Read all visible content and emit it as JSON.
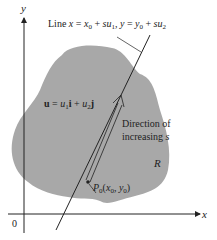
{
  "diagram": {
    "region_color": "#a8a8a8",
    "axes": {
      "x_label": "x",
      "y_label": "y",
      "origin_label": "0"
    },
    "line_label": {
      "prefix": "Line ",
      "x": "x",
      "eq1": " = ",
      "x0": "x",
      "x0_sub": "0",
      "plus1": " + ",
      "su1_s": "su",
      "su1_sub": "1",
      "comma": ", ",
      "y": "y",
      "eq2": " = ",
      "y0": "y",
      "y0_sub": "0",
      "plus2": " + ",
      "su2_s": "su",
      "su2_sub": "2"
    },
    "vector_label": {
      "u": "u",
      "eq": " = ",
      "u1": "u",
      "u1_sub": "1",
      "i": "i",
      "plus": " + ",
      "u2": "u",
      "u2_sub": "2",
      "j": "j"
    },
    "direction_label": {
      "line1": "Direction of",
      "line2_text": "increasing ",
      "line2_var": "s"
    },
    "region_label": "R",
    "point_label": {
      "P": "P",
      "P_sub": "0",
      "open": "(",
      "x": "x",
      "x_sub": "0",
      "comma": ", ",
      "y": "y",
      "y_sub": "0",
      "close": ")"
    }
  }
}
